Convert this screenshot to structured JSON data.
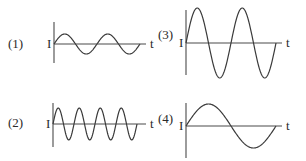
{
  "graphs": [
    {
      "label": "(1)",
      "y_label": "I",
      "x_label": "t",
      "origin": [
        54,
        44
      ],
      "axis_top": 22,
      "axis_bottom": 63,
      "axis_right": 146,
      "amplitude": 10,
      "period": 43,
      "cycles": 2,
      "label_pos": [
        8,
        38
      ]
    },
    {
      "label": "(2)",
      "y_label": "I",
      "x_label": "t",
      "origin": [
        53,
        124
      ],
      "axis_top": 103,
      "axis_bottom": 147,
      "axis_right": 146,
      "amplitude": 16,
      "period": 21,
      "cycles": 4,
      "label_pos": [
        8,
        117
      ]
    },
    {
      "label": "(3)",
      "y_label": "I",
      "x_label": "t",
      "origin": [
        186,
        43
      ],
      "axis_top": 10,
      "axis_bottom": 75,
      "axis_right": 282,
      "amplitude": 35,
      "period": 45,
      "cycles": 2,
      "label_pos": [
        158,
        29
      ]
    },
    {
      "label": "(4)",
      "y_label": "I",
      "x_label": "t",
      "origin": [
        186,
        126
      ],
      "axis_top": 103,
      "axis_bottom": 158,
      "axis_right": 282,
      "amplitude": 22,
      "period": 90,
      "cycles": 1,
      "label_pos": [
        158,
        113
      ]
    }
  ],
  "colors": {
    "axis": "#4a4a4a",
    "wave": "#3a3a3a",
    "text": "#2a2a2a"
  }
}
